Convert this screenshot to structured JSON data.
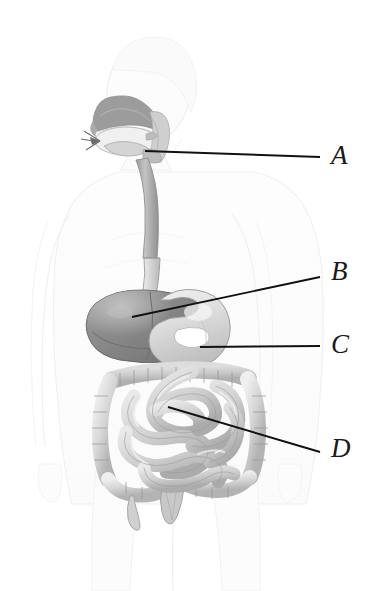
{
  "figure": {
    "style": "grayscale-pencil-shaded-anatomical-illustration",
    "background_color": "#ffffff",
    "line_color": "#111111",
    "label_color": "#1a1a1a"
  },
  "labels": [
    {
      "id": "A",
      "text": "A",
      "label_x": 331,
      "label_y": 142,
      "points_to": "pharynx-upper-esophagus",
      "leader_line": {
        "x1": 145,
        "y1": 151,
        "x2": 320,
        "y2": 157
      }
    },
    {
      "id": "B",
      "text": "B",
      "label_x": 331,
      "label_y": 258,
      "points_to": "liver",
      "leader_line": {
        "x1": 132,
        "y1": 317,
        "x2": 320,
        "y2": 277
      }
    },
    {
      "id": "C",
      "text": "C",
      "label_x": 331,
      "label_y": 331,
      "points_to": "stomach",
      "leader_line": {
        "x1": 200,
        "y1": 347,
        "x2": 320,
        "y2": 346
      }
    },
    {
      "id": "D",
      "text": "D",
      "label_x": 331,
      "label_y": 435,
      "points_to": "small-intestine",
      "leader_line": {
        "x1": 168,
        "y1": 407,
        "x2": 320,
        "y2": 452
      }
    }
  ],
  "anatomy": {
    "body_outline": {
      "name": "body-silhouette",
      "fill": "#fcfcfc",
      "stroke": "#ededed"
    },
    "nasal_cavity": {
      "name": "nasal-cavity",
      "fill": "#9c9c9c"
    },
    "oral_cavity": {
      "name": "oral-cavity",
      "fill": "#e8e8e8"
    },
    "tongue": {
      "name": "tongue",
      "fill": "#d4d4d4"
    },
    "pharynx": {
      "name": "pharynx",
      "fill": "#bdbdbd"
    },
    "esophagus": {
      "name": "esophagus",
      "fill": "#b4b4b4"
    },
    "liver": {
      "name": "liver",
      "fill": "#8a8a8a"
    },
    "stomach": {
      "name": "stomach",
      "fill": "#dcdcdc"
    },
    "large_intestine": {
      "name": "large-intestine",
      "fill": "#d9d9d9"
    },
    "small_intestine": {
      "name": "small-intestine",
      "fill": "#d2d2d2"
    },
    "appendix": {
      "name": "appendix",
      "fill": "#d0d0d0"
    },
    "rectum": {
      "name": "rectum",
      "fill": "#c8c8c8"
    }
  },
  "palette": {
    "dark_gray": "#6e6e6e",
    "mid_gray": "#9c9c9c",
    "light_gray": "#d9d9d9",
    "outline_gray": "#8e8e8e",
    "faint_outline": "#efefef",
    "black": "#111111"
  }
}
